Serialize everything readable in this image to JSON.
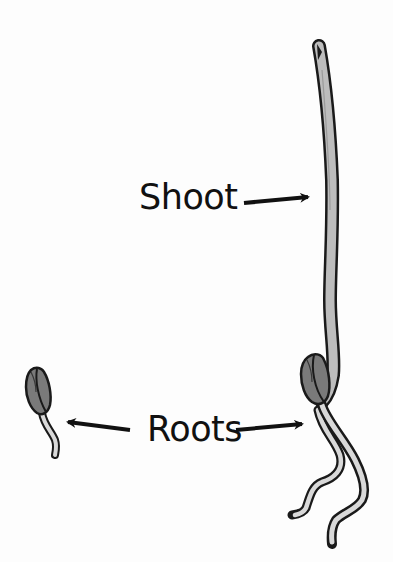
{
  "diagram": {
    "title": "",
    "labels": {
      "shoot": "Shoot",
      "roots": "Roots"
    },
    "parts": [
      {
        "name": "small-seed",
        "description": "Ungerminated seed with a single emerging root",
        "position": "left"
      },
      {
        "name": "seedling",
        "description": "Germinated seedling with tall shoot and two roots",
        "position": "right"
      }
    ],
    "arrows": [
      {
        "from": "Shoot",
        "to": "seedling-shoot",
        "direction": "right"
      },
      {
        "from": "Roots",
        "to": "small-seed-root",
        "direction": "left"
      },
      {
        "from": "Roots",
        "to": "seedling-roots",
        "direction": "right"
      }
    ],
    "colors": {
      "outline": "#1a1a1a",
      "shoot_fill": "#bdbdbd",
      "seed_fill": "#7a7a7a",
      "root_fill": "#d9d9d9",
      "background": "#fdfdfd"
    }
  }
}
